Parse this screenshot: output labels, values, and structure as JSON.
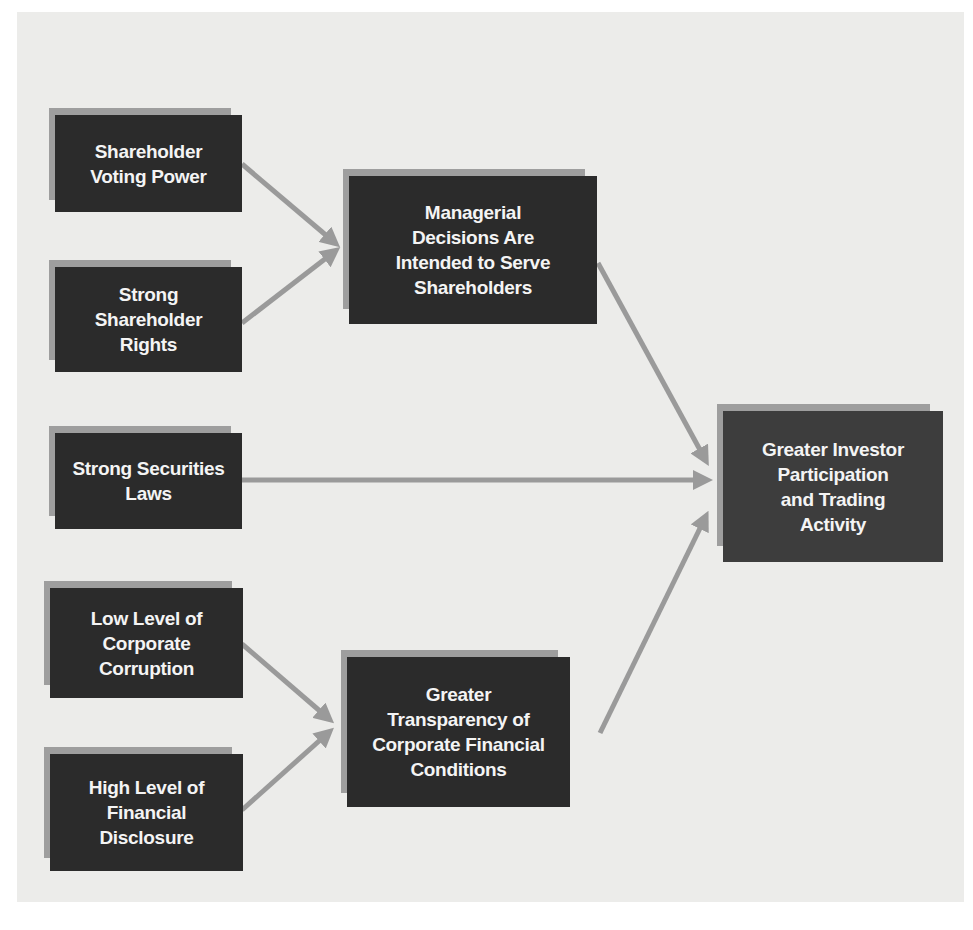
{
  "diagram": {
    "background_color": "#ececea",
    "box_color": "#2b2b2b",
    "shadow_color": "#9e9e9e",
    "arrow_color": "#9a9a9a",
    "nodes": {
      "voting_power": {
        "label": "Shareholder\nVoting Power"
      },
      "shareholder_rights": {
        "label": "Strong\nShareholder\nRights"
      },
      "securities_laws": {
        "label": "Strong Securities\nLaws"
      },
      "low_corruption": {
        "label": "Low Level of\nCorporate\nCorruption"
      },
      "financial_disclosure": {
        "label": "High Level of\nFinancial\nDisclosure"
      },
      "managerial_decisions": {
        "label": "Managerial\nDecisions Are\nIntended to Serve\nShareholders"
      },
      "transparency": {
        "label": "Greater\nTransparency of\nCorporate Financial\nConditions"
      },
      "investor_participation": {
        "label": "Greater Investor\nParticipation\nand Trading\nActivity"
      }
    },
    "edges": [
      {
        "from": "voting_power",
        "to": "managerial_decisions"
      },
      {
        "from": "shareholder_rights",
        "to": "managerial_decisions"
      },
      {
        "from": "managerial_decisions",
        "to": "investor_participation"
      },
      {
        "from": "securities_laws",
        "to": "investor_participation"
      },
      {
        "from": "low_corruption",
        "to": "transparency"
      },
      {
        "from": "financial_disclosure",
        "to": "transparency"
      },
      {
        "from": "transparency",
        "to": "investor_participation"
      }
    ]
  }
}
